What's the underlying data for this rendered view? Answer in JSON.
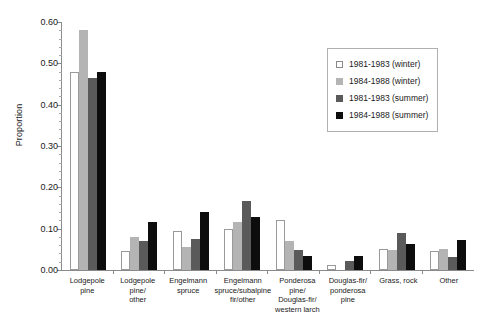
{
  "chart_data": {
    "type": "bar",
    "title": "",
    "xlabel": "",
    "ylabel": "Proportion",
    "ylim": [
      0,
      0.6
    ],
    "ytick_step": 0.1,
    "yminor_step": 0.02,
    "grid": false,
    "legend_position": "top-right",
    "ytick_labels": [
      "0.60",
      "0.50",
      "0.40",
      "0.30",
      "0.20",
      "0.10",
      "0.00"
    ],
    "ytick_values": [
      0.6,
      0.5,
      0.4,
      0.3,
      0.2,
      0.1,
      0.0
    ],
    "categories": [
      "Lodgepole pine",
      "Lodgepole pine/\nother",
      "Engelmann\nspruce",
      "Engelmann\nspruce/subalpine\nfir/other",
      "Ponderosa pine/\nDouglas-fir/\nwestern larch",
      "Douglas-fir/\nponderosa pine",
      "Grass, rock",
      "Other"
    ],
    "series": [
      {
        "name": "1981-1983 (winter)",
        "color": "#ffffff",
        "values": [
          0.48,
          0.045,
          0.095,
          0.1,
          0.12,
          0.012,
          0.05,
          0.045
        ]
      },
      {
        "name": "1984-1988 (winter)",
        "color": "#b4b4b4",
        "values": [
          0.58,
          0.08,
          0.055,
          0.115,
          0.07,
          0.0,
          0.048,
          0.052
        ]
      },
      {
        "name": "1981-1983 (summer)",
        "color": "#5a5a5a",
        "values": [
          0.465,
          0.07,
          0.075,
          0.168,
          0.048,
          0.022,
          0.09,
          0.032
        ]
      },
      {
        "name": "1984-1988 (summer)",
        "color": "#0d0d0d",
        "values": [
          0.48,
          0.115,
          0.14,
          0.128,
          0.035,
          0.035,
          0.062,
          0.072
        ]
      }
    ]
  }
}
